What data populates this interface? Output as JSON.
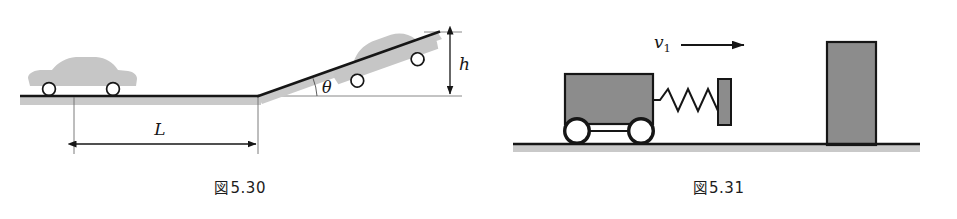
{
  "page": {
    "background_color": "#ffffff",
    "width": 957,
    "height": 219
  },
  "figures": [
    {
      "id": "fig-5-30",
      "caption_prefix": "図",
      "caption_number": "5.30",
      "caption_full": "図 5.30",
      "description": "car on flat road of length L approaching an incline of angle theta rising to height h",
      "labels": {
        "length": "L",
        "angle": "θ",
        "height": "h"
      },
      "colors": {
        "line": "#161616",
        "road_fill": "#c9c9c9",
        "car_fill": "#c6c6c6",
        "wheel_fill": "#ffffff",
        "thin_line": "#6d6d6d"
      }
    },
    {
      "id": "fig-5-31",
      "caption_prefix": "図",
      "caption_number": "5.31",
      "caption_full": "図 5.31",
      "description": "cart with spring and plate moving at velocity v1 toward a fixed wall block on the ground",
      "labels": {
        "velocity": "v",
        "velocity_subscript": "1",
        "velocity_full": "v₁"
      },
      "colors": {
        "line": "#161616",
        "ground_fill": "#c9c9c9",
        "cart_fill": "#8c8c8c",
        "plate_fill": "#8c8c8c",
        "wall_fill": "#8c8c8c",
        "wheel_fill": "#ffffff"
      }
    }
  ]
}
